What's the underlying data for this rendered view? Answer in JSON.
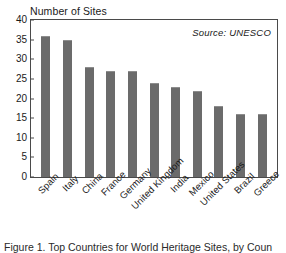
{
  "figure": {
    "caption": "Figure 1. Top Countries for World Heritage Sites, by Coun"
  },
  "chart_data": {
    "type": "bar",
    "title": "Number of Sites",
    "xlabel": "",
    "ylabel": "Number of Sites",
    "categories": [
      "Spain",
      "Italy",
      "China",
      "France",
      "Germany",
      "United Kingdom",
      "India",
      "Mexico",
      "United States",
      "Brazil",
      "Greece"
    ],
    "values": [
      36,
      35,
      28,
      27,
      27,
      24,
      23,
      22,
      18,
      16,
      16
    ],
    "ylim": [
      0,
      40
    ],
    "ytick_step": 5,
    "yticks": [
      0,
      5,
      10,
      15,
      20,
      25,
      30,
      35,
      40
    ],
    "ytick_labels": [
      "0",
      "5",
      "10",
      "15",
      "20",
      "25",
      "30",
      "35",
      "40"
    ],
    "grid": false,
    "legend": null,
    "annotations": [
      {
        "name": "source",
        "text": "Source: UNESCO",
        "position": "top-right",
        "style": "italic"
      }
    ],
    "bar_color": "#6b6b6b",
    "frame_color": "#4a4a4a",
    "background": "#ffffff"
  }
}
